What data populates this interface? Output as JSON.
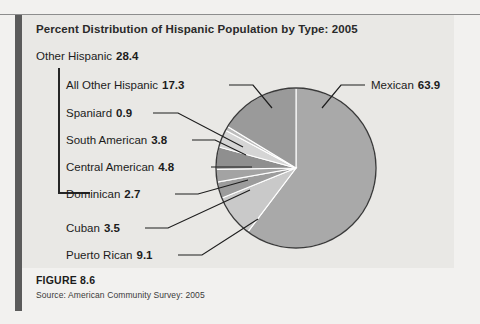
{
  "figure": {
    "title": "Percent Distribution of Hispanic Population by Type: 2005",
    "number": "FIGURE 8.6",
    "source": "Source: American Community Survey: 2005"
  },
  "labels": {
    "other_hispanic": {
      "name": "Other Hispanic",
      "value": "28.4"
    },
    "all_other_hispanic": {
      "name": "All Other Hispanic",
      "value": "17.3"
    },
    "spaniard": {
      "name": "Spaniard",
      "value": "0.9"
    },
    "south_american": {
      "name": "South American",
      "value": "3.8"
    },
    "central_american": {
      "name": "Central American",
      "value": "4.8"
    },
    "dominican": {
      "name": "Dominican",
      "value": "2.7"
    },
    "cuban": {
      "name": "Cuban",
      "value": "3.5"
    },
    "puerto_rican": {
      "name": "Puerto Rican",
      "value": "9.1"
    },
    "mexican": {
      "name": "Mexican",
      "value": "63.9"
    }
  },
  "chart_data": {
    "type": "pie",
    "title": "Percent Distribution of Hispanic Population by Type: 2005",
    "unit": "percent",
    "total": 100.0,
    "start_angle_deg": 0,
    "direction": "clockwise",
    "legend": "none-callout-labels",
    "categories": [
      "Mexican",
      "Puerto Rican",
      "Cuban",
      "Dominican",
      "Central American",
      "South American",
      "Spaniard",
      "All Other Hispanic"
    ],
    "values": [
      63.9,
      9.1,
      3.5,
      2.7,
      4.8,
      3.8,
      0.9,
      17.3
    ],
    "slice_colors": [
      "#a9a9a9",
      "#c9c9c9",
      "#9c9c9c",
      "#a3a3a3",
      "#8f8f8f",
      "#d5d5d5",
      "#bdbdbd",
      "#9a9a9a"
    ],
    "grouping": {
      "Other Hispanic": {
        "value": 28.4,
        "members": [
          "Dominican",
          "Central American",
          "South American",
          "Spaniard",
          "All Other Hispanic"
        ]
      }
    }
  },
  "style": {
    "page_background": "#f2f1ef",
    "panel_background": "#e9e8e5",
    "left_bar": "#5b5b5b",
    "outline": "#3a3a3a"
  }
}
